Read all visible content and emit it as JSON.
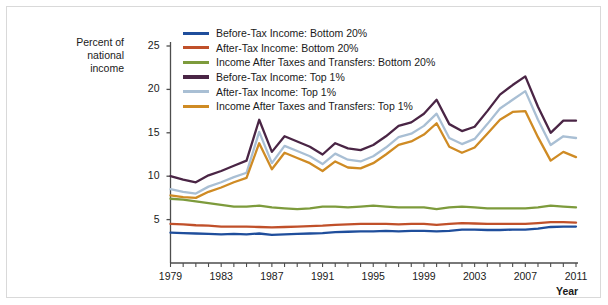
{
  "figure": {
    "y_axis_title": "Percent of\nnational\nincome",
    "x_axis_title": "Year"
  },
  "legend": {
    "items": [
      {
        "label": "Before-Tax Income: Bottom 20%",
        "color": "#1f4e9c"
      },
      {
        "label": "After-Tax Income: Bottom 20%",
        "color": "#c0502a"
      },
      {
        "label": "Income After Taxes and Transfers: Bottom 20%",
        "color": "#7d9b3c"
      },
      {
        "label": "Before-Tax Income: Top 1%",
        "color": "#4a2545"
      },
      {
        "label": "After-Tax Income: Top 1%",
        "color": "#a9bfd4"
      },
      {
        "label": "Income After Taxes and Transfers: Top 1%",
        "color": "#cf8b24"
      }
    ]
  },
  "chart_data": {
    "type": "line",
    "title": "",
    "xlabel": "Year",
    "ylabel": "Percent of national income",
    "xlim": [
      1979,
      2011
    ],
    "ylim": [
      0,
      25
    ],
    "yticks": [
      5,
      10,
      15,
      20,
      25
    ],
    "xticks": [
      1979,
      1983,
      1987,
      1991,
      1995,
      1999,
      2003,
      2007,
      2011
    ],
    "xticks_minor_step": 1,
    "grid": false,
    "legend_position": "top-center",
    "x": [
      1979,
      1980,
      1981,
      1982,
      1983,
      1984,
      1985,
      1986,
      1987,
      1988,
      1989,
      1990,
      1991,
      1992,
      1993,
      1994,
      1995,
      1996,
      1997,
      1998,
      1999,
      2000,
      2001,
      2002,
      2003,
      2004,
      2005,
      2006,
      2007,
      2008,
      2009,
      2010,
      2011
    ],
    "series": [
      {
        "name": "Before-Tax Income: Top 1%",
        "color": "#4a2545",
        "values": [
          10.0,
          9.6,
          9.3,
          10.1,
          10.6,
          11.2,
          11.8,
          16.5,
          12.8,
          14.6,
          14.0,
          13.4,
          12.5,
          13.8,
          13.2,
          13.0,
          13.6,
          14.6,
          15.8,
          16.2,
          17.2,
          18.8,
          16.0,
          15.2,
          15.7,
          17.5,
          19.4,
          20.5,
          21.5,
          18.0,
          15.0,
          16.4,
          16.4
        ]
      },
      {
        "name": "After-Tax Income: Top 1%",
        "color": "#a9bfd4",
        "values": [
          8.5,
          8.2,
          8.0,
          8.8,
          9.3,
          9.9,
          10.4,
          15.1,
          11.5,
          13.5,
          12.9,
          12.3,
          11.4,
          12.6,
          11.9,
          11.7,
          12.3,
          13.3,
          14.5,
          14.9,
          15.8,
          17.2,
          14.4,
          13.7,
          14.3,
          16.0,
          17.8,
          18.8,
          19.8,
          16.5,
          13.6,
          14.6,
          14.4
        ]
      },
      {
        "name": "Income After Taxes and Transfers: Top 1%",
        "color": "#cf8b24",
        "values": [
          7.8,
          7.6,
          7.5,
          8.2,
          8.7,
          9.3,
          9.8,
          13.8,
          10.8,
          12.7,
          12.1,
          11.5,
          10.6,
          11.7,
          11.0,
          10.9,
          11.5,
          12.5,
          13.6,
          14.0,
          14.8,
          16.1,
          13.4,
          12.7,
          13.3,
          14.9,
          16.5,
          17.4,
          17.5,
          14.5,
          11.8,
          12.8,
          12.2
        ]
      },
      {
        "name": "Income After Taxes and Transfers: Bottom 20%",
        "color": "#7d9b3c",
        "values": [
          7.4,
          7.3,
          7.1,
          6.9,
          6.7,
          6.5,
          6.5,
          6.6,
          6.4,
          6.3,
          6.2,
          6.3,
          6.5,
          6.5,
          6.4,
          6.5,
          6.6,
          6.5,
          6.4,
          6.4,
          6.4,
          6.2,
          6.4,
          6.5,
          6.4,
          6.3,
          6.3,
          6.3,
          6.3,
          6.4,
          6.6,
          6.5,
          6.4
        ]
      },
      {
        "name": "After-Tax Income: Bottom 20%",
        "color": "#c0502a",
        "values": [
          4.5,
          4.45,
          4.35,
          4.3,
          4.2,
          4.2,
          4.2,
          4.15,
          4.1,
          4.15,
          4.2,
          4.25,
          4.3,
          4.4,
          4.45,
          4.5,
          4.5,
          4.5,
          4.45,
          4.5,
          4.5,
          4.4,
          4.5,
          4.6,
          4.55,
          4.5,
          4.5,
          4.5,
          4.5,
          4.6,
          4.7,
          4.7,
          4.65
        ]
      },
      {
        "name": "Before-Tax Income: Bottom 20%",
        "color": "#1f4e9c",
        "values": [
          3.5,
          3.45,
          3.4,
          3.35,
          3.3,
          3.35,
          3.3,
          3.4,
          3.25,
          3.3,
          3.35,
          3.4,
          3.45,
          3.55,
          3.6,
          3.65,
          3.65,
          3.7,
          3.65,
          3.7,
          3.7,
          3.65,
          3.7,
          3.85,
          3.85,
          3.8,
          3.8,
          3.85,
          3.85,
          3.95,
          4.15,
          4.2,
          4.2
        ]
      }
    ]
  }
}
